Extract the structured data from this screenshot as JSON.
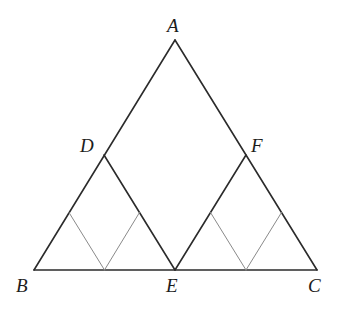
{
  "figure": {
    "width": 345,
    "height": 309,
    "background_color": "#ffffff",
    "primary_stroke_color": "#2b2b2b",
    "secondary_stroke_color": "#8a8a8a",
    "primary_stroke_width": 1.6,
    "secondary_stroke_width": 1.0,
    "points": {
      "A": {
        "label": "A",
        "x": 175,
        "y": 40
      },
      "B": {
        "label": "B",
        "x": 34,
        "y": 270
      },
      "C": {
        "label": "C",
        "x": 317,
        "y": 270
      },
      "D": {
        "label": "D",
        "x": 104,
        "y": 155
      },
      "E": {
        "label": "E",
        "x": 175,
        "y": 270
      },
      "F": {
        "label": "F",
        "x": 246,
        "y": 155
      },
      "M_BD": {
        "label": "",
        "x": 69,
        "y": 212.5
      },
      "M_BE": {
        "label": "",
        "x": 104.5,
        "y": 270
      },
      "M_DE": {
        "label": "",
        "x": 139.5,
        "y": 212.5
      },
      "M_EF": {
        "label": "",
        "x": 210.5,
        "y": 212.5
      },
      "M_EC": {
        "label": "",
        "x": 246,
        "y": 270
      },
      "M_FC": {
        "label": "",
        "x": 281.5,
        "y": 212.5
      }
    },
    "label_positions": {
      "A": {
        "text": "A",
        "left": 167,
        "top": 16
      },
      "B": {
        "text": "B",
        "left": 16,
        "top": 276
      },
      "C": {
        "text": "C",
        "left": 308,
        "top": 276
      },
      "D": {
        "text": "D",
        "left": 80,
        "top": 136
      },
      "E": {
        "text": "E",
        "left": 166,
        "top": 276
      },
      "F": {
        "text": "F",
        "left": 251,
        "top": 136
      }
    },
    "primary_segments": [
      {
        "name": "segment-AB",
        "from": "A",
        "to": "B"
      },
      {
        "name": "segment-AC",
        "from": "A",
        "to": "C"
      },
      {
        "name": "segment-BC",
        "from": "B",
        "to": "C"
      },
      {
        "name": "segment-DE",
        "from": "D",
        "to": "E"
      },
      {
        "name": "segment-EF",
        "from": "E",
        "to": "F"
      }
    ],
    "secondary_segments": [
      {
        "name": "segment-mBD-mBE",
        "from": "M_BD",
        "to": "M_BE"
      },
      {
        "name": "segment-mBE-mDE",
        "from": "M_BE",
        "to": "M_DE"
      },
      {
        "name": "segment-mEF-mEC",
        "from": "M_EF",
        "to": "M_EC"
      },
      {
        "name": "segment-mEC-mFC",
        "from": "M_EC",
        "to": "M_FC"
      }
    ]
  }
}
